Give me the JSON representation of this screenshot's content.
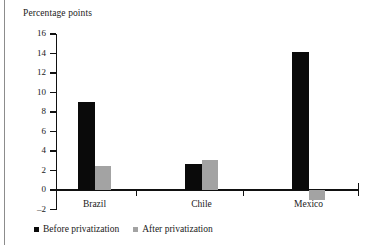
{
  "chart_data": {
    "type": "bar",
    "title": "Percentage points",
    "xlabel": "",
    "ylabel": "Percentage points",
    "categories": [
      "Brazil",
      "Chile",
      "Mexico"
    ],
    "series": [
      {
        "name": "Before privatization",
        "color": "#0a0a0a",
        "values": [
          9.0,
          2.7,
          14.2
        ]
      },
      {
        "name": "After privatization",
        "color": "#a3a3a3",
        "values": [
          2.5,
          3.1,
          -1.0
        ]
      }
    ],
    "ylim": [
      -2,
      16
    ],
    "yticks": [
      16,
      14,
      12,
      10,
      8,
      6,
      4,
      2,
      0,
      -2
    ],
    "ytick_labels": [
      "16",
      "14",
      "12",
      "10",
      "8",
      "6",
      "4",
      "2",
      "0",
      "–2"
    ],
    "grid": false,
    "legend_position": "bottom-left",
    "zero_line": 0
  },
  "axis": {
    "title": "Percentage points"
  },
  "legend": {
    "items": [
      {
        "label": "Before privatization",
        "swatch": "black-square-swatch"
      },
      {
        "label": "After privatization",
        "swatch": "gray-square-swatch"
      }
    ]
  },
  "ticks": {
    "y": [
      {
        "label": "16",
        "value": 16
      },
      {
        "label": "14",
        "value": 14
      },
      {
        "label": "12",
        "value": 12
      },
      {
        "label": "10",
        "value": 10
      },
      {
        "label": "8",
        "value": 8
      },
      {
        "label": "6",
        "value": 6
      },
      {
        "label": "4",
        "value": 4
      },
      {
        "label": "2",
        "value": 2
      },
      {
        "label": "0",
        "value": 0
      },
      {
        "label": "–2",
        "value": -2
      }
    ],
    "x": [
      {
        "label": "Brazil"
      },
      {
        "label": "Chile"
      },
      {
        "label": "Mexico"
      }
    ]
  },
  "colors": {
    "before": "#0a0a0a",
    "after": "#a3a3a3",
    "axis": "#111111",
    "frame_rule": "#8c8c8c",
    "background": "#ffffff"
  }
}
